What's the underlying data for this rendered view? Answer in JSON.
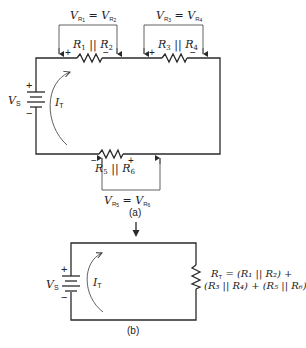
{
  "figure_a": {
    "caption": "(a)",
    "source": {
      "label": "V",
      "sub": "S",
      "plus": "+",
      "minus": "−"
    },
    "current": {
      "label": "I",
      "sub": "T"
    },
    "resistors": [
      {
        "label_left": "R",
        "sub_left": "1",
        "sep": " || ",
        "label_right": "R",
        "sub_right": "2",
        "polarity_left": "+",
        "polarity_right": "−",
        "voltage": {
          "lhs": "V",
          "lhs_sub1": "R",
          "lhs_sub2": "1",
          "eq": " = ",
          "rhs": "V",
          "rhs_sub1": "R",
          "rhs_sub2": "2"
        }
      },
      {
        "label_left": "R",
        "sub_left": "3",
        "sep": " || ",
        "label_right": "R",
        "sub_right": "4",
        "polarity_left": "+",
        "polarity_right": "−",
        "voltage": {
          "lhs": "V",
          "lhs_sub1": "R",
          "lhs_sub2": "3",
          "eq": " = ",
          "rhs": "V",
          "rhs_sub1": "R",
          "rhs_sub2": "4"
        }
      },
      {
        "label_left": "R",
        "sub_left": "5",
        "sep": " || ",
        "label_right": "R",
        "sub_right": "6",
        "polarity_left": "−",
        "polarity_right": "+",
        "voltage": {
          "lhs": "V",
          "lhs_sub1": "R",
          "lhs_sub2": "5",
          "eq": " = ",
          "rhs": "V",
          "rhs_sub1": "R",
          "rhs_sub2": "6"
        }
      }
    ]
  },
  "figure_b": {
    "caption": "(b)",
    "source": {
      "label": "V",
      "sub": "S",
      "plus": "+",
      "minus": "−"
    },
    "current": {
      "label": "I",
      "sub": "T"
    },
    "equivalent": {
      "line1_lhs": "R",
      "line1_lhs_sub": "T",
      "line1": " = (R₁ || R₂) +",
      "line2": "(R₃ || R₄) + (R₅ || R₆)"
    }
  },
  "transition_arrow": "down-arrow"
}
